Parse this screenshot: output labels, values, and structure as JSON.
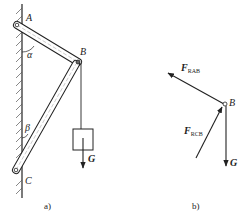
{
  "figure_a": {
    "caption": "a)",
    "points": {
      "A": "A",
      "B": "B",
      "C": "C"
    },
    "angles": {
      "alpha": "α",
      "beta": "β"
    },
    "load_label": "G"
  },
  "figure_b": {
    "caption": "b)",
    "point": "B",
    "forces": [
      {
        "main": "F",
        "sub": "RAB"
      },
      {
        "main": "F",
        "sub": "RCB"
      },
      {
        "main": "G",
        "sub": ""
      }
    ]
  },
  "colors": {
    "ink": "#222222",
    "background": "#ffffff"
  }
}
